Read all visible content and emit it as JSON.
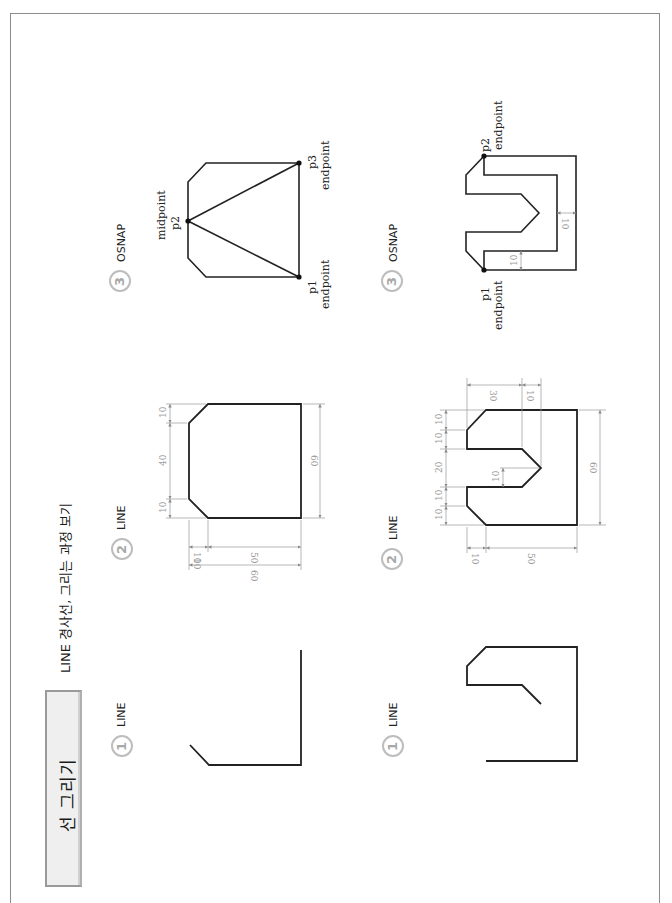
{
  "header": {
    "section_title": "선 그리기",
    "subtitle": "LINE 경사선, 그리는 과정 보기"
  },
  "rows": [
    {
      "steps": [
        {
          "number": "1",
          "command": "LINE"
        },
        {
          "number": "2",
          "command": "LINE",
          "dimensions": {
            "left_top_chamfer": "10",
            "left_middle": "40",
            "left_bottom_chamfer": "10",
            "height": "60",
            "bottom_chamfer": "10",
            "bottom_width": "50",
            "total_width": "60"
          }
        },
        {
          "number": "3",
          "command": "OSNAP",
          "points": [
            {
              "name": "p1",
              "snap": "endpoint"
            },
            {
              "name": "p2",
              "snap": "midpoint"
            },
            {
              "name": "p3",
              "snap": "endpoint"
            }
          ]
        }
      ]
    },
    {
      "steps": [
        {
          "number": "1",
          "command": "LINE"
        },
        {
          "number": "2",
          "command": "LINE",
          "dimensions": {
            "top_left_width": "30",
            "top_right_width": "10",
            "seg1": "10",
            "seg2": "10",
            "slot": "20",
            "seg4": "10",
            "seg5": "10",
            "v_tip": "10",
            "height": "60",
            "bottom_chamfer": "10",
            "bottom_width": "50"
          }
        },
        {
          "number": "3",
          "command": "OSNAP",
          "points": [
            {
              "name": "p1",
              "snap": "endpoint"
            },
            {
              "name": "p2",
              "snap": "endpoint"
            }
          ],
          "offsets": {
            "inner": "10",
            "side": "10"
          }
        }
      ]
    }
  ],
  "colors": {
    "line": "#222222",
    "dimension": "#9a9a9a",
    "circle": "#bdbdbd",
    "frame": "#8c8c8c",
    "tab_bg": "#efefef"
  }
}
